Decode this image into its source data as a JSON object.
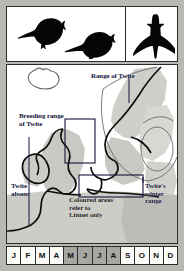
{
  "figure": {
    "type": "bird-distribution-plate",
    "silhouettes": [
      {
        "id": "perched-left",
        "icon": "bird-perched-silhouette-icon"
      },
      {
        "id": "perched-right",
        "icon": "bird-perched-silhouette-icon"
      },
      {
        "id": "in-flight",
        "icon": "bird-flying-silhouette-icon"
      }
    ],
    "map": {
      "labels": {
        "range_of_twite": "Range of Twite",
        "breeding_range_of_twite": "Breeding range\nof Twite",
        "twite_absent": "Twite\nabsent",
        "twite_winter_range": "Twite's\nwinter\nrange",
        "coloured_areas_note": "Coloured areas\nrefer to\nLinnet only"
      },
      "colors": {
        "land_shaded": "#c9c9c3",
        "land_shaded_light": "#ddddd7",
        "coastline": "#101010",
        "range_outline": "#4a4a4a",
        "sea": "#ffffff",
        "label_text": "#15153c",
        "frame": "#2b2b2b",
        "plate_border": "#b9b9b3"
      }
    },
    "month_strip": {
      "months": [
        {
          "label": "J",
          "highlighted": false
        },
        {
          "label": "F",
          "highlighted": false
        },
        {
          "label": "M",
          "highlighted": false
        },
        {
          "label": "A",
          "highlighted": false
        },
        {
          "label": "M",
          "highlighted": true
        },
        {
          "label": "J",
          "highlighted": true
        },
        {
          "label": "J",
          "highlighted": true
        },
        {
          "label": "A",
          "highlighted": true
        },
        {
          "label": "S",
          "highlighted": false
        },
        {
          "label": "O",
          "highlighted": false
        },
        {
          "label": "N",
          "highlighted": false
        },
        {
          "label": "D",
          "highlighted": false
        }
      ],
      "highlight_color": "#a8a8a2"
    }
  }
}
